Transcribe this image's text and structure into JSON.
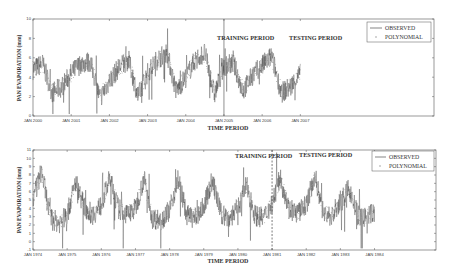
{
  "chart_data": [
    {
      "type": "line",
      "title": "",
      "xlabel": "TIME PERIOD",
      "ylabel": "PAN EVAPORATION (mm)",
      "ylim": [
        0,
        10
      ],
      "yticks": [
        0,
        2,
        4,
        6,
        8,
        10
      ],
      "x_tick_labels": [
        "JAN 2000",
        "JAN 2001",
        "JAN 2002",
        "JAN 2003",
        "JAN 2004",
        "JAN 2005",
        "JAN 2006",
        "JAN 2007"
      ],
      "annotations": [
        "TRAINING PERIOD",
        "TESTING PERIOD"
      ],
      "split_at": "JAN 2005",
      "grid": false,
      "legend_position": "upper right",
      "series": [
        {
          "name": "OBSERVED",
          "style": "line",
          "x": [
            2000.0,
            2000.25,
            2000.5,
            2000.75,
            2001.0,
            2001.25,
            2001.5,
            2001.75,
            2002.0,
            2002.25,
            2002.5,
            2002.75,
            2003.0,
            2003.25,
            2003.5,
            2003.75,
            2004.0,
            2004.25,
            2004.5,
            2004.75,
            2005.0,
            2005.25,
            2005.5,
            2005.75,
            2006.0,
            2006.25,
            2006.5,
            2006.75,
            2007.0
          ],
          "values": [
            4.8,
            5.4,
            2.4,
            3.0,
            4.4,
            5.4,
            5.6,
            1.8,
            3.6,
            5.0,
            5.8,
            2.0,
            4.4,
            5.8,
            6.6,
            2.6,
            4.0,
            5.8,
            6.5,
            2.2,
            5.2,
            5.4,
            2.6,
            4.2,
            5.2,
            6.2,
            2.4,
            3.0,
            4.4
          ]
        },
        {
          "name": "POLYNOMIAL",
          "style": "markers",
          "x": [
            2000.0,
            2000.25,
            2000.5,
            2000.75,
            2001.0,
            2001.25,
            2001.5,
            2001.75,
            2002.0,
            2002.25,
            2002.5,
            2002.75,
            2003.0,
            2003.25,
            2003.5,
            2003.75,
            2004.0,
            2004.25,
            2004.5,
            2004.75,
            2005.0,
            2005.25,
            2005.5,
            2005.75,
            2006.0,
            2006.25,
            2006.5,
            2006.75,
            2007.0
          ],
          "values": [
            4.9,
            5.3,
            2.6,
            3.1,
            4.3,
            5.3,
            5.5,
            2.0,
            3.7,
            4.9,
            5.7,
            2.2,
            4.3,
            5.7,
            6.4,
            2.8,
            4.1,
            5.7,
            6.3,
            2.4,
            5.1,
            5.3,
            2.8,
            4.1,
            5.1,
            6.0,
            2.6,
            3.1,
            4.3
          ]
        }
      ]
    },
    {
      "type": "line",
      "title": "",
      "xlabel": "TIME PERIOD",
      "ylabel": "PAN EVAPORATION (mm)",
      "ylim": [
        -1,
        11
      ],
      "yticks": [
        -1,
        0,
        1,
        2,
        3,
        4,
        5,
        6,
        7,
        8,
        9,
        10,
        11
      ],
      "x_tick_labels": [
        "JAN 1974",
        "JAN 1975",
        "JAN 1976",
        "JAN 1977",
        "JAN 1978",
        "JAN 1979",
        "JAN 1980",
        "JAN 1981",
        "JAN 1982",
        "JAN 1983",
        "JAN 1984"
      ],
      "annotations": [
        "TRAINING PERIOD",
        "TESTING PERIOD"
      ],
      "split_at": "JAN 1981",
      "grid": false,
      "legend_position": "upper right",
      "series": [
        {
          "name": "OBSERVED",
          "style": "line",
          "x": [
            1974.0,
            1974.25,
            1974.5,
            1974.75,
            1975.0,
            1975.25,
            1975.5,
            1975.75,
            1976.0,
            1976.25,
            1976.5,
            1976.75,
            1977.0,
            1977.25,
            1977.5,
            1977.75,
            1978.0,
            1978.25,
            1978.5,
            1978.75,
            1979.0,
            1979.25,
            1979.5,
            1979.75,
            1980.0,
            1980.25,
            1980.5,
            1980.75,
            1981.0,
            1981.25,
            1981.5,
            1981.75,
            1982.0,
            1982.25,
            1982.5,
            1982.75,
            1983.0,
            1983.25,
            1983.5,
            1983.75,
            1984.0
          ],
          "values": [
            5.0,
            8.5,
            3.0,
            2.2,
            3.2,
            7.2,
            4.2,
            3.2,
            4.4,
            7.6,
            4.0,
            3.2,
            4.0,
            7.6,
            2.8,
            2.6,
            3.8,
            7.6,
            3.2,
            2.8,
            4.2,
            7.4,
            3.4,
            2.8,
            4.0,
            6.8,
            3.2,
            2.8,
            4.6,
            7.8,
            3.8,
            3.4,
            4.4,
            8.0,
            3.4,
            3.0,
            4.6,
            6.4,
            3.2,
            2.8,
            3.6
          ]
        },
        {
          "name": "POLYNOMIAL",
          "style": "markers",
          "x": [
            1974.0,
            1974.25,
            1974.5,
            1974.75,
            1975.0,
            1975.25,
            1975.5,
            1975.75,
            1976.0,
            1976.25,
            1976.5,
            1976.75,
            1977.0,
            1977.25,
            1977.5,
            1977.75,
            1978.0,
            1978.25,
            1978.5,
            1978.75,
            1979.0,
            1979.25,
            1979.5,
            1979.75,
            1980.0,
            1980.25,
            1980.5,
            1980.75,
            1981.0,
            1981.25,
            1981.5,
            1981.75,
            1982.0,
            1982.25,
            1982.5,
            1982.75,
            1983.0,
            1983.25,
            1983.5,
            1983.75,
            1984.0
          ],
          "values": [
            5.1,
            8.2,
            3.2,
            2.4,
            3.3,
            7.0,
            4.3,
            3.3,
            4.3,
            7.4,
            4.1,
            3.3,
            4.1,
            7.3,
            3.0,
            2.8,
            3.9,
            7.3,
            3.3,
            2.9,
            4.2,
            7.2,
            3.5,
            3.0,
            4.1,
            6.6,
            3.3,
            2.9,
            4.6,
            7.5,
            3.9,
            3.5,
            4.4,
            7.7,
            3.5,
            3.1,
            4.6,
            6.2,
            3.3,
            2.9,
            3.7
          ]
        }
      ]
    }
  ],
  "figure": {
    "top": {
      "ylabel": "PAN EVAPORATION (mm)",
      "xlabel": "TIME PERIOD",
      "training_label": "TRAINING PERIOD",
      "testing_label": "TESTING PERIOD",
      "legend_observed": "OBSERVED",
      "legend_polynomial": "POLYNOMIAL"
    },
    "bottom": {
      "ylabel": "PAN EVAPORATION (mm)",
      "xlabel": "TIME PERIOD",
      "training_label": "TRAINING PERIOD",
      "testing_label": "TESTING PERIOD",
      "legend_observed": "OBSERVED",
      "legend_polynomial": "POLYNOMIAL"
    }
  },
  "colors": {
    "observed": "#333333",
    "polynomial": "#9a9a9a",
    "axis": "#555555"
  }
}
